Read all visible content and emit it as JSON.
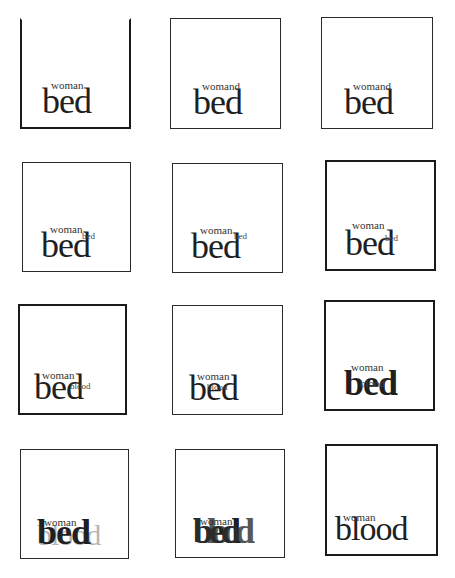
{
  "panels": [
    {
      "id": 1,
      "overlay": "woman",
      "main": "bed",
      "residue": ""
    },
    {
      "id": 2,
      "overlay": "womand",
      "main": "bed",
      "residue": ""
    },
    {
      "id": 3,
      "overlay": "womand",
      "main": "bed",
      "residue": ""
    },
    {
      "id": 4,
      "overlay": "woman",
      "main": "bed",
      "residue": "bed"
    },
    {
      "id": 5,
      "overlay": "woman",
      "main": "bed",
      "residue": "bed"
    },
    {
      "id": 6,
      "overlay": "woman",
      "main": "bed",
      "residue": "bed"
    },
    {
      "id": 7,
      "overlay": "woman",
      "main": "bed",
      "residue": "blood"
    },
    {
      "id": 8,
      "overlay": "woman",
      "main": "bed",
      "residue": "blood"
    },
    {
      "id": 9,
      "overlay": "woman",
      "main": "bed",
      "residue": "blood"
    },
    {
      "id": 10,
      "overlay": "woman",
      "main": "bed",
      "residue": "blood"
    },
    {
      "id": 11,
      "overlay": "woman",
      "main": "bed",
      "residue": "blood"
    },
    {
      "id": 12,
      "overlay": "woman",
      "main": "blood",
      "residue": ""
    }
  ]
}
